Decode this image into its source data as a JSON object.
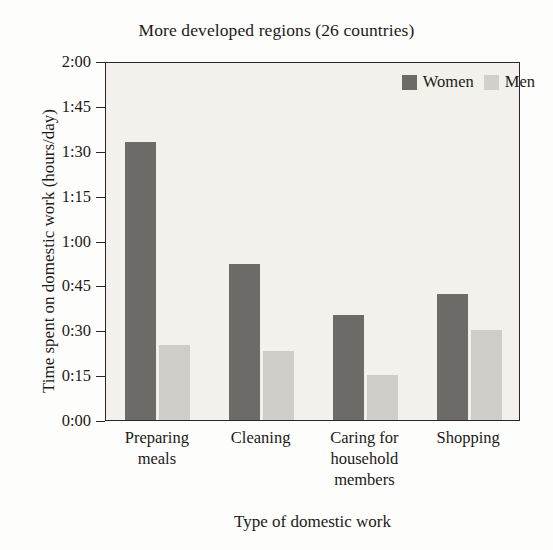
{
  "chart_data": {
    "type": "bar",
    "title": "More developed regions (26 countries)",
    "xlabel": "Type of domestic work",
    "ylabel": "Time spent on domestic work (hours/day)",
    "categories": [
      "Preparing\nmeals",
      "Cleaning",
      "Caring for\nhousehold\nmembers",
      "Shopping"
    ],
    "series": [
      {
        "name": "Women",
        "color": "#6d6a67",
        "values": [
          93,
          52,
          35,
          42
        ],
        "value_labels": [
          "1:33",
          "0:52",
          "0:35",
          "0:42"
        ]
      },
      {
        "name": "Men",
        "color": "#cfcdc8",
        "values": [
          25,
          23,
          15,
          30
        ],
        "value_labels": [
          "0:25",
          "0:23",
          "0:15",
          "0:30"
        ]
      }
    ],
    "yticks": [
      "0:00",
      "0:15",
      "0:30",
      "0:45",
      "1:00",
      "1:15",
      "1:30",
      "1:45",
      "2:00"
    ],
    "ytick_values": [
      0,
      15,
      30,
      45,
      60,
      75,
      90,
      105,
      120
    ],
    "ylim": [
      0,
      120
    ],
    "unit": "minutes per day",
    "grid": false,
    "legend_position": "top-right"
  },
  "background_text": "s thing to note is that these sex\n work load between men and women\nto region. As we see in Figure 1, in\n 26 countries, women spend more\nin men on all four types of domestic\ns. In Figure 2 (40 countries), wome\n work than men in all areas except\n dominated by men.\n    The relative importance of each\n"
}
